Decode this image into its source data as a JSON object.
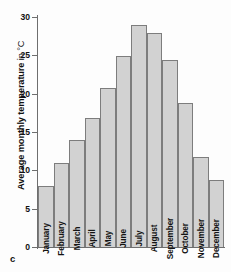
{
  "figure": {
    "caption_letter": "c"
  },
  "chart_data": {
    "type": "bar",
    "title": "",
    "xlabel": "",
    "ylabel": "Average monthly temperature in °C",
    "ylabel_bold_part": "Average monthly temperature",
    "ylabel_unit_part": " in °C",
    "categories": [
      "January",
      "February",
      "March",
      "April",
      "May",
      "June",
      "July",
      "August",
      "September",
      "October",
      "November",
      "December"
    ],
    "values": [
      8.0,
      11.0,
      14.0,
      16.8,
      20.8,
      24.9,
      29.0,
      27.9,
      24.4,
      18.8,
      11.7,
      8.7
    ],
    "ylim": [
      0,
      30
    ],
    "yticks": [
      0,
      5,
      10,
      15,
      20,
      25,
      30
    ],
    "ytick_labels": [
      "0",
      "5",
      "10",
      "15",
      "20",
      "25",
      "30"
    ],
    "grid": false,
    "legend": null,
    "bar_color": "#d2d2d2",
    "bar_border_color": "#7d7d7d",
    "axis_color": "#6e6e6e"
  }
}
